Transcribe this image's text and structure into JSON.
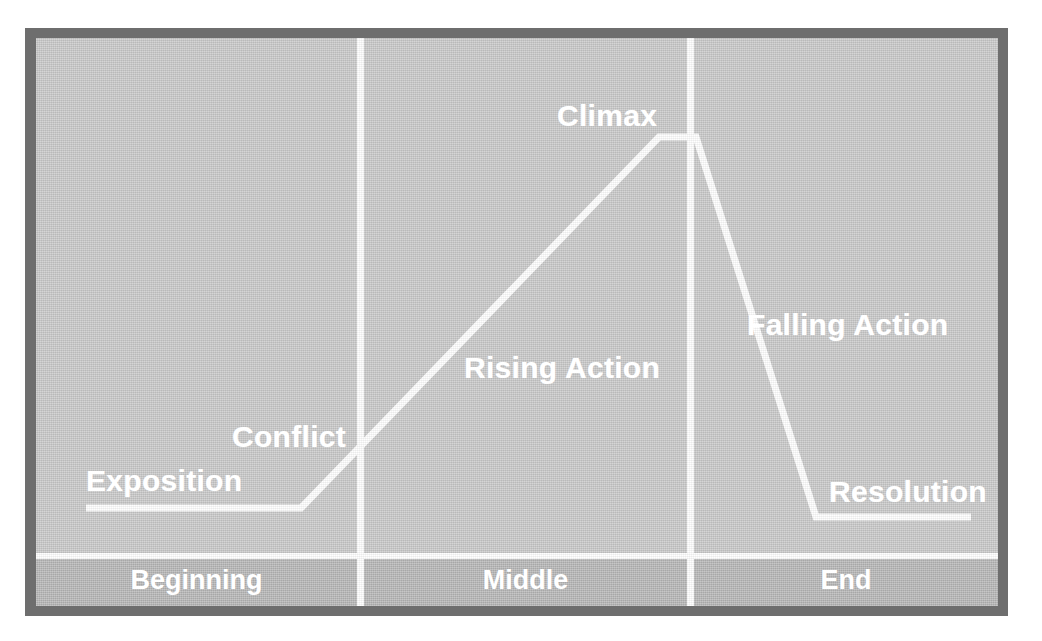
{
  "colors": {
    "frame": "#6e6e6e",
    "plate": "#c9c9c9",
    "band": "#b6b6b6",
    "line": "#ffffff",
    "text": "#ffffff",
    "page": "#ffffff"
  },
  "curve": {
    "stroke": "#ffffff",
    "stroke_width": 7,
    "points": "50,470 265,470 623,99 660,99 780,479 935,479"
  },
  "stage_labels": [
    {
      "key": "beginning",
      "label": "Beginning"
    },
    {
      "key": "middle",
      "label": "Middle"
    },
    {
      "key": "end",
      "label": "End"
    }
  ],
  "plot_labels": [
    {
      "key": "exposition",
      "label": "Exposition"
    },
    {
      "key": "conflict",
      "label": "Conflict"
    },
    {
      "key": "rising_action",
      "label": "Rising Action"
    },
    {
      "key": "climax",
      "label": "Climax"
    },
    {
      "key": "falling_action",
      "label": "Falling Action"
    },
    {
      "key": "resolution",
      "label": "Resolution"
    }
  ],
  "chart_data": {
    "type": "line",
    "xlabel": "",
    "ylabel": "",
    "grid": false,
    "legend": "none",
    "xlim": [
      0,
      100
    ],
    "ylim": [
      0,
      100
    ],
    "categories": [
      "Beginning",
      "Middle",
      "End"
    ],
    "series": [
      {
        "name": "Narrative tension",
        "x": [
          5,
          27,
          64,
          68,
          80,
          96
        ],
        "y": [
          12,
          12,
          92,
          92,
          10,
          10
        ]
      }
    ],
    "annotations": [
      {
        "text": "Exposition",
        "x": 10,
        "y": 20,
        "stage": "Beginning"
      },
      {
        "text": "Conflict",
        "x": 25,
        "y": 28,
        "stage": "Beginning"
      },
      {
        "text": "Rising Action",
        "x": 48,
        "y": 42,
        "stage": "Middle"
      },
      {
        "text": "Climax",
        "x": 62,
        "y": 96,
        "stage": "Middle"
      },
      {
        "text": "Falling Action",
        "x": 82,
        "y": 50,
        "stage": "End"
      },
      {
        "text": "Resolution",
        "x": 90,
        "y": 18,
        "stage": "End"
      }
    ],
    "stage_dividers": [
      33,
      66
    ]
  }
}
